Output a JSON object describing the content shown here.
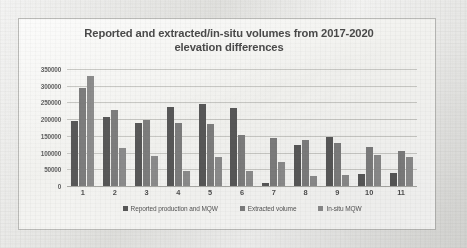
{
  "chart_data": {
    "type": "bar",
    "title": "Reported and extracted/in-situ volumes from 2017-2020 elevation differences",
    "title_line1": "Reported and extracted/in-situ volumes from 2017-2020",
    "title_line2": "elevation differences",
    "xlabel": "",
    "ylabel": "",
    "ylim": [
      0,
      350000
    ],
    "ytick_labels": [
      "350000",
      "300000",
      "250000",
      "200000",
      "150000",
      "100000",
      "50000",
      "0"
    ],
    "ytick_values": [
      350000,
      300000,
      250000,
      200000,
      150000,
      100000,
      50000,
      0
    ],
    "grid": true,
    "legend_position": "bottom",
    "categories": [
      "1",
      "2",
      "3",
      "4",
      "5",
      "6",
      "7",
      "8",
      "9",
      "10",
      "11"
    ],
    "series": [
      {
        "name": "Reported production and MQW",
        "color": "#585858",
        "values": [
          195000,
          205000,
          188000,
          237000,
          245000,
          232000,
          8000,
          123000,
          147000,
          35000,
          38000
        ]
      },
      {
        "name": "Extracted volume",
        "color": "#7d7d7d",
        "values": [
          293000,
          226000,
          197000,
          189000,
          185000,
          154000,
          144000,
          138000,
          128000,
          117000,
          105000
        ]
      },
      {
        "name": "In-situ MQW",
        "color": "#8c8c8c",
        "values": [
          328000,
          113000,
          90000,
          44000,
          86000,
          46000,
          73000,
          31000,
          33000,
          92000,
          88000
        ]
      }
    ]
  }
}
